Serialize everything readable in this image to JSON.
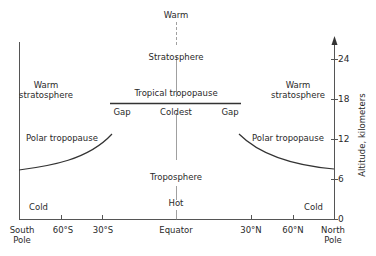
{
  "diagram": {
    "regions": {
      "center_top": "Warm",
      "stratosphere": "Stratosphere",
      "left_warm_stratosphere": [
        "Warm",
        "stratosphere"
      ],
      "right_warm_stratosphere": [
        "Warm",
        "stratosphere"
      ],
      "tropical_tropopause": "Tropical tropopause",
      "gap_left": "Gap",
      "coldest": "Coldest",
      "gap_right": "Gap",
      "polar_tropopause_left": "Polar tropopause",
      "polar_tropopause_right": "Polar tropopause",
      "troposphere": "Troposphere",
      "hot": "Hot",
      "cold_left": "Cold",
      "cold_right": "Cold"
    },
    "x_axis": {
      "labels": [
        {
          "text": [
            "South",
            "Pole"
          ]
        },
        {
          "text": [
            "60°S"
          ]
        },
        {
          "text": [
            "30°S"
          ]
        },
        {
          "text": [
            "Equator"
          ]
        },
        {
          "text": [
            "30°N"
          ]
        },
        {
          "text": [
            "60°N"
          ]
        },
        {
          "text": [
            "North",
            "Pole"
          ]
        }
      ]
    },
    "y_axis": {
      "title": "Altitude, kilometers",
      "ticks": [
        "24",
        "18",
        "12",
        "6",
        "0"
      ]
    }
  }
}
